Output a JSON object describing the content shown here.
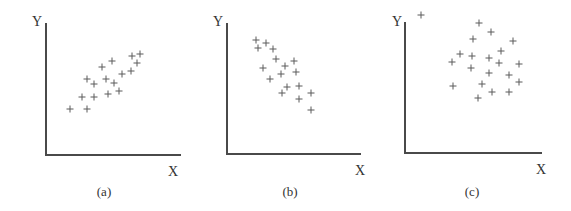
{
  "chart_data": [
    {
      "type": "scatter",
      "caption": "(a)",
      "xlabel": "X",
      "ylabel": "Y",
      "description": "positive correlation",
      "grid": false,
      "frame": {
        "origin": [
          46,
          155
        ],
        "x_end": 181,
        "y_top": 23,
        "ylabel_pos": [
          32,
          26
        ],
        "xlabel_pos": [
          168,
          176
        ],
        "caption_pos": [
          104,
          196
        ]
      },
      "points": [
        [
          140,
          54
        ],
        [
          132,
          56
        ],
        [
          137,
          63
        ],
        [
          112,
          61
        ],
        [
          102,
          67
        ],
        [
          131,
          71
        ],
        [
          122,
          74
        ],
        [
          87,
          79
        ],
        [
          106,
          79
        ],
        [
          94,
          84
        ],
        [
          114,
          83
        ],
        [
          119,
          91
        ],
        [
          108,
          94
        ],
        [
          82,
          97
        ],
        [
          94,
          97
        ],
        [
          70,
          109
        ],
        [
          87,
          109
        ]
      ]
    },
    {
      "type": "scatter",
      "caption": "(b)",
      "xlabel": "X",
      "ylabel": "Y",
      "description": "negative correlation",
      "grid": false,
      "frame": {
        "origin": [
          227,
          154
        ],
        "x_end": 361,
        "y_top": 23,
        "ylabel_pos": [
          213,
          26
        ],
        "xlabel_pos": [
          355,
          175
        ],
        "caption_pos": [
          290,
          196
        ]
      },
      "points": [
        [
          256,
          40
        ],
        [
          266,
          43
        ],
        [
          258,
          48
        ],
        [
          273,
          49
        ],
        [
          276,
          59
        ],
        [
          294,
          61
        ],
        [
          285,
          66
        ],
        [
          263,
          68
        ],
        [
          281,
          74
        ],
        [
          296,
          72
        ],
        [
          270,
          79
        ],
        [
          287,
          87
        ],
        [
          299,
          86
        ],
        [
          282,
          93
        ],
        [
          311,
          93
        ],
        [
          299,
          99
        ],
        [
          311,
          110
        ]
      ]
    },
    {
      "type": "scatter",
      "caption": "(c)",
      "xlabel": "X",
      "ylabel": "Y",
      "description": "no correlation",
      "grid": false,
      "frame": {
        "origin": [
          405,
          153
        ],
        "x_end": 542,
        "y_top": 22,
        "ylabel_pos": [
          392,
          26
        ],
        "xlabel_pos": [
          536,
          174
        ],
        "caption_pos": [
          472,
          196
        ]
      },
      "points": [
        [
          421,
          15
        ],
        [
          479,
          23
        ],
        [
          491,
          32
        ],
        [
          473,
          39
        ],
        [
          513,
          41
        ],
        [
          501,
          51
        ],
        [
          460,
          54
        ],
        [
          472,
          56
        ],
        [
          489,
          58
        ],
        [
          452,
          62
        ],
        [
          499,
          63
        ],
        [
          519,
          64
        ],
        [
          471,
          68
        ],
        [
          489,
          73
        ],
        [
          509,
          75
        ],
        [
          519,
          82
        ],
        [
          482,
          84
        ],
        [
          453,
          86
        ],
        [
          492,
          92
        ],
        [
          509,
          92
        ],
        [
          478,
          98
        ]
      ]
    }
  ]
}
